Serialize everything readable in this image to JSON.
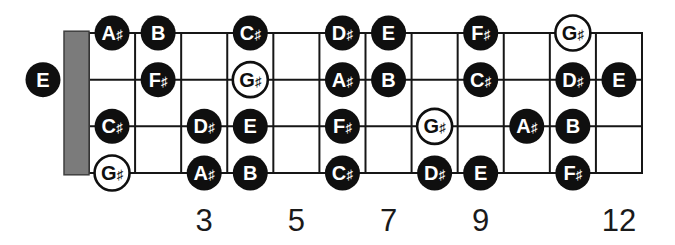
{
  "diagram": {
    "type": "fretboard",
    "instrument_strings": 4,
    "fret_count": 12,
    "colors": {
      "background": "#ffffff",
      "line": "#161616",
      "nut_fill": "#7b7b7b",
      "nut_border": "#3f3f3f",
      "note_fill": "#0f0f0f",
      "note_text": "#ffffff",
      "hollow_fill": "#ffffff",
      "hollow_border": "#0f0f0f",
      "hollow_text": "#0f0f0f",
      "fret_number_text": "#1a1a1a"
    },
    "open_notes": [
      {
        "string": 2,
        "label": "E",
        "hollow": false
      }
    ],
    "notes": [
      {
        "string": 1,
        "fret": 1,
        "label": "A#",
        "hollow": false
      },
      {
        "string": 1,
        "fret": 2,
        "label": "B",
        "hollow": false
      },
      {
        "string": 1,
        "fret": 4,
        "label": "C#",
        "hollow": false
      },
      {
        "string": 1,
        "fret": 6,
        "label": "D#",
        "hollow": false
      },
      {
        "string": 1,
        "fret": 7,
        "label": "E",
        "hollow": false
      },
      {
        "string": 1,
        "fret": 9,
        "label": "F#",
        "hollow": false
      },
      {
        "string": 1,
        "fret": 11,
        "label": "G#",
        "hollow": true
      },
      {
        "string": 2,
        "fret": 2,
        "label": "F#",
        "hollow": false
      },
      {
        "string": 2,
        "fret": 4,
        "label": "G#",
        "hollow": true
      },
      {
        "string": 2,
        "fret": 6,
        "label": "A#",
        "hollow": false
      },
      {
        "string": 2,
        "fret": 7,
        "label": "B",
        "hollow": false
      },
      {
        "string": 2,
        "fret": 9,
        "label": "C#",
        "hollow": false
      },
      {
        "string": 2,
        "fret": 11,
        "label": "D#",
        "hollow": false
      },
      {
        "string": 2,
        "fret": 12,
        "label": "E",
        "hollow": false
      },
      {
        "string": 3,
        "fret": 1,
        "label": "C#",
        "hollow": false
      },
      {
        "string": 3,
        "fret": 3,
        "label": "D#",
        "hollow": false
      },
      {
        "string": 3,
        "fret": 4,
        "label": "E",
        "hollow": false
      },
      {
        "string": 3,
        "fret": 6,
        "label": "F#",
        "hollow": false
      },
      {
        "string": 3,
        "fret": 8,
        "label": "G#",
        "hollow": true
      },
      {
        "string": 3,
        "fret": 10,
        "label": "A#",
        "hollow": false
      },
      {
        "string": 3,
        "fret": 11,
        "label": "B",
        "hollow": false
      },
      {
        "string": 4,
        "fret": 1,
        "label": "G#",
        "hollow": true
      },
      {
        "string": 4,
        "fret": 3,
        "label": "A#",
        "hollow": false
      },
      {
        "string": 4,
        "fret": 4,
        "label": "B",
        "hollow": false
      },
      {
        "string": 4,
        "fret": 6,
        "label": "C#",
        "hollow": false
      },
      {
        "string": 4,
        "fret": 8,
        "label": "D#",
        "hollow": false
      },
      {
        "string": 4,
        "fret": 9,
        "label": "E",
        "hollow": false
      },
      {
        "string": 4,
        "fret": 11,
        "label": "F#",
        "hollow": false
      }
    ],
    "fret_numbers": [
      {
        "fret": 3,
        "label": "3"
      },
      {
        "fret": 5,
        "label": "5"
      },
      {
        "fret": 7,
        "label": "7"
      },
      {
        "fret": 9,
        "label": "9"
      },
      {
        "fret": 12,
        "label": "12"
      }
    ]
  }
}
